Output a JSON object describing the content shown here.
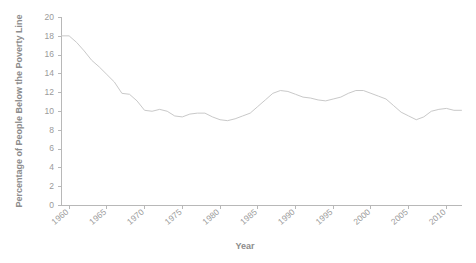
{
  "chart_data": {
    "type": "line",
    "title": "",
    "xlabel": "Year",
    "ylabel": "Percentage of People Below the Poverty Line",
    "xlim": [
      1959,
      2012
    ],
    "ylim": [
      0,
      20
    ],
    "grid": false,
    "legend": "none",
    "line_color": "#c9c9c9",
    "axis_color": "#b8b8b8",
    "label_color": "#9a9a9a",
    "title_color": "#8c8c8c",
    "background": "#ffffff",
    "xticks": [
      1960,
      1965,
      1970,
      1975,
      1980,
      1985,
      1990,
      1995,
      2000,
      2005,
      2010
    ],
    "xtick_labels": [
      "1960",
      "1965",
      "1970",
      "1975",
      "1980",
      "1985",
      "1990",
      "1995",
      "2000",
      "2005",
      "2010"
    ],
    "yticks": [
      0,
      2,
      4,
      6,
      8,
      10,
      12,
      14,
      16,
      18,
      20
    ],
    "ytick_labels": [
      "0",
      "2",
      "4",
      "6",
      "8",
      "10",
      "12",
      "14",
      "16",
      "18",
      "20"
    ],
    "series": [
      {
        "name": "Poverty Rate",
        "x": [
          1959,
          1960,
          1961,
          1962,
          1963,
          1964,
          1965,
          1966,
          1967,
          1968,
          1969,
          1970,
          1971,
          1972,
          1973,
          1974,
          1975,
          1976,
          1977,
          1978,
          1979,
          1980,
          1981,
          1982,
          1983,
          1984,
          1985,
          1986,
          1987,
          1988,
          1989,
          1990,
          1991,
          1992,
          1993,
          1994,
          1995,
          1996,
          1997,
          1998,
          1999,
          2000,
          2001,
          2002,
          2003,
          2004,
          2005,
          2006,
          2007,
          2008,
          2009,
          2010,
          2011,
          2012
        ],
        "values": [
          18.0,
          18.0,
          17.3,
          16.4,
          15.4,
          14.7,
          13.9,
          13.1,
          11.9,
          11.8,
          11.1,
          10.1,
          10.0,
          10.2,
          10.0,
          9.5,
          9.4,
          9.7,
          9.8,
          9.8,
          9.4,
          9.1,
          9.0,
          9.2,
          9.5,
          9.8,
          10.5,
          11.2,
          11.9,
          12.2,
          12.1,
          11.8,
          11.5,
          11.4,
          11.2,
          11.1,
          11.3,
          11.5,
          11.9,
          12.2,
          12.2,
          11.9,
          11.6,
          11.3,
          10.6,
          9.9,
          9.5,
          9.1,
          9.4,
          10.0,
          10.2,
          10.3,
          10.1,
          10.1
        ]
      }
    ],
    "series_detail_note": "Rendered path is a smooth continuous line; values are read off the axis at each plotted year."
  }
}
